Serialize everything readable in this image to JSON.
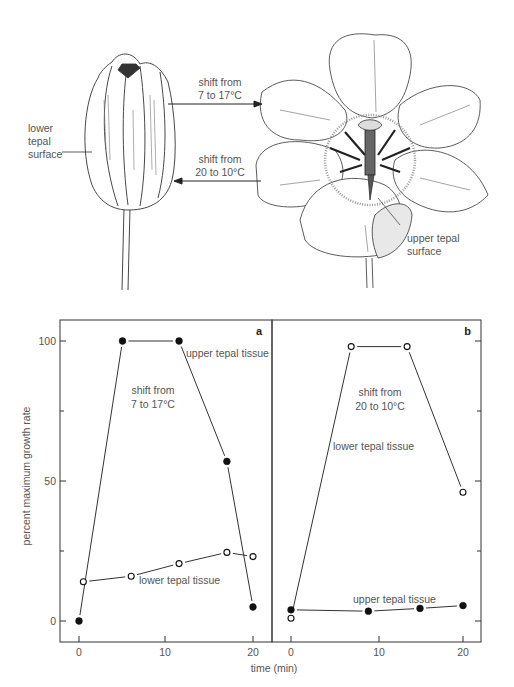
{
  "illustration": {
    "closed_flower_label": "lower\ntepal\nsurface",
    "closed_flower_label_lines": [
      "lower",
      "tepal",
      "surface"
    ],
    "open_flower_label_lines": [
      "upper tepal",
      "surface"
    ],
    "arrow_open": {
      "line1": "shift from",
      "line2": "7 to 17°C",
      "direction": "right"
    },
    "arrow_close": {
      "line1": "shift from",
      "line2": "20 to 10°C",
      "direction": "left"
    }
  },
  "axes": {
    "ylabel": "percent maximum growth rate",
    "xlabel": "time (min)",
    "y_ticks": [
      "0",
      "50",
      "100"
    ],
    "x_ticks": [
      "0",
      "10",
      "20"
    ]
  },
  "chart_data": [
    {
      "type": "line",
      "panel": "a",
      "annotation": "shift from 7 to 17°C",
      "annotation_lines": [
        "shift from",
        "7 to 17°C"
      ],
      "xlabel": "time (min)",
      "ylabel": "percent maximum growth rate",
      "xlim": [
        -2,
        22
      ],
      "ylim": [
        -7,
        108
      ],
      "grid": false,
      "series": [
        {
          "name": "upper tepal tissue",
          "marker": "filled-circle",
          "x": [
            0,
            5,
            11.5,
            17,
            20
          ],
          "y": [
            0,
            100,
            100,
            57,
            5
          ]
        },
        {
          "name": "lower tepal tissue",
          "marker": "open-circle",
          "x": [
            0.5,
            6,
            11.5,
            17,
            20
          ],
          "y": [
            14,
            16,
            20.5,
            24.5,
            23
          ]
        }
      ]
    },
    {
      "type": "line",
      "panel": "b",
      "annotation": "shift from 20 to 10°C",
      "annotation_lines": [
        "shift from",
        "20 to 10°C"
      ],
      "xlabel": "time (min)",
      "ylabel": "percent maximum growth rate",
      "xlim": [
        -2,
        22
      ],
      "ylim": [
        -7,
        108
      ],
      "grid": false,
      "series": [
        {
          "name": "lower tepal tissue",
          "marker": "open-circle",
          "x": [
            0,
            7,
            13.5,
            20
          ],
          "y": [
            1,
            98,
            98,
            46
          ]
        },
        {
          "name": "upper tepal tissue",
          "marker": "filled-circle",
          "x": [
            0,
            9,
            15,
            20
          ],
          "y": [
            4,
            3.5,
            4.5,
            5.5
          ]
        }
      ]
    }
  ],
  "labels": {
    "a_upper": "upper tepal tissue",
    "a_lower": "lower tepal tissue",
    "b_lower": "lower tepal tissue",
    "b_upper": "upper tepal tissue",
    "panel_a": "a",
    "panel_b": "b"
  }
}
